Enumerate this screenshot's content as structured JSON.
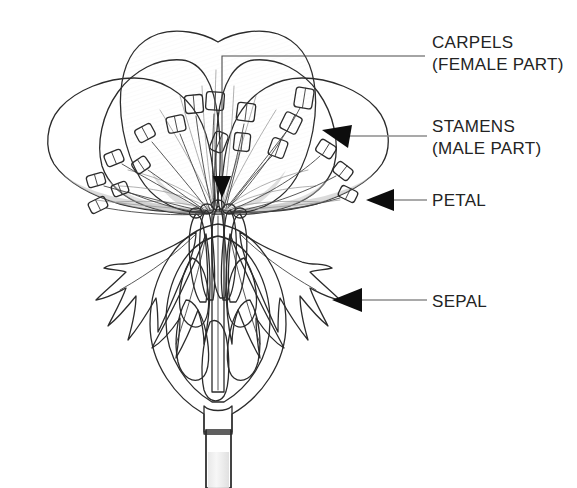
{
  "diagram": {
    "style": "pencil-shaded line drawing",
    "canvas": {
      "width": 577,
      "height": 488
    },
    "background_color": "#ffffff"
  },
  "labels": [
    {
      "id": "carpels",
      "line1": "CARPELS",
      "line2": "(FEMALE PART)",
      "text_x": 432,
      "line1_y": 48,
      "line2_y": 70,
      "pointer_type": "bracket-line",
      "leader": {
        "x1": 222,
        "y1": 56,
        "x2": 222,
        "y2": 185,
        "elbow_x": 425,
        "elbow_y": 56
      },
      "arrow": {
        "tip_x": 222,
        "tip_y": 196,
        "direction": "down"
      }
    },
    {
      "id": "stamens",
      "line1": "STAMENS",
      "line2": "(MALE PART)",
      "text_x": 432,
      "line1_y": 132,
      "line2_y": 154,
      "pointer_type": "arrow-line",
      "leader": {
        "x1": 345,
        "y1": 137,
        "x2": 427,
        "y2": 137
      },
      "arrow": {
        "tip_x": 325,
        "tip_y": 131,
        "direction": "left-up"
      }
    },
    {
      "id": "petal",
      "line1": "PETAL",
      "line2": "",
      "text_x": 432,
      "line1_y": 206,
      "line2_y": 0,
      "pointer_type": "arrow-line",
      "leader": {
        "x1": 388,
        "y1": 200,
        "x2": 427,
        "y2": 200
      },
      "arrow": {
        "tip_x": 368,
        "tip_y": 200,
        "direction": "left"
      }
    },
    {
      "id": "sepal",
      "line1": "SEPAL",
      "line2": "",
      "text_x": 432,
      "line1_y": 307,
      "line2_y": 0,
      "pointer_type": "arrow-line",
      "leader": {
        "x1": 355,
        "y1": 300,
        "x2": 427,
        "y2": 300
      },
      "arrow": {
        "tip_x": 334,
        "tip_y": 300,
        "direction": "left"
      }
    }
  ],
  "parts": {
    "petals": {
      "name": "petals",
      "count": 5,
      "fill": "#ededed",
      "outline": "#2b2b2b",
      "description": "five broad overlapping pale-gray petals fanning upward and outward"
    },
    "stamens": {
      "name": "stamens",
      "count": 18,
      "anther_fill": "#cfcfcf",
      "filament_color": "#3a3a3a",
      "description": "slender filaments topped by oblong anthers scattered across the petal face"
    },
    "carpels": {
      "name": "carpels",
      "count": 5,
      "fill": "#f7f7f7",
      "description": "central cluster of pale club-shaped pistils rising from the ovary"
    },
    "sepals": {
      "name": "sepals",
      "count": 4,
      "fill": "#9a9a9a",
      "outline": "#2b2b2b",
      "description": "dark gray jagged-edged sepals splaying downward beneath the petals"
    },
    "ovary": {
      "name": "ovary",
      "fill": "#e4e4e4",
      "texture": "stippled",
      "description": "stippled teardrop-shaped ovary wall shown in cut-away section"
    },
    "ovules": {
      "name": "ovules",
      "count": 6,
      "fill": "#e3e3e3",
      "outline": "#2b2b2b",
      "description": "pale teardrop ovules inside the ovary chamber"
    },
    "stem": {
      "name": "stem",
      "fill": "#efefef",
      "texture": "stippled",
      "description": "stippled vertical stem descending from the base of the ovary"
    }
  },
  "colors": {
    "ink": "#2b2b2b",
    "text": "#232323",
    "leader_line": "#8d8d8d",
    "arrow": "#0d0d0d",
    "petal_light": "#f2f2f2",
    "petal_mid": "#e2e2e2",
    "petal_shadow": "#c8c8c8",
    "sepal_gray": "#9a9a9a",
    "sepal_dark": "#6f6f6f",
    "background": "#ffffff"
  }
}
